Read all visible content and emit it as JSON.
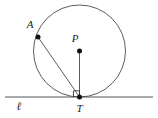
{
  "figure": {
    "type": "geometry-diagram",
    "background_color": "#ffffff",
    "stroke_color": "#3a3a3a",
    "label_color": "#1a1a1a",
    "labels": {
      "point_a": "A",
      "point_p": "P",
      "point_t": "T",
      "line_l": "ℓ"
    },
    "geometry": {
      "circle": {
        "center_x": 79.5,
        "center_y": 51,
        "radius": 46
      },
      "points": [
        {
          "name": "A",
          "x": 38,
          "y": 37,
          "label_x": 30,
          "label_y": 28
        },
        {
          "name": "P",
          "x": 79.5,
          "y": 51,
          "label_x": 73,
          "label_y": 42
        },
        {
          "name": "T",
          "x": 79.5,
          "y": 97,
          "label_x": 76,
          "label_y": 111
        }
      ],
      "tangent_line": {
        "name": "l",
        "x1": 5,
        "y1": 97,
        "x2": 153,
        "y2": 97,
        "label_x": 17,
        "label_y": 109
      },
      "segments": [
        {
          "name": "chord-AT",
          "x1": 38,
          "y1": 37,
          "x2": 79.5,
          "y2": 97
        },
        {
          "name": "radius-PT",
          "x1": 79.5,
          "y1": 51,
          "x2": 79.5,
          "y2": 97
        }
      ],
      "right_angle_mark": {
        "at_point": "T",
        "size": 6
      }
    }
  }
}
